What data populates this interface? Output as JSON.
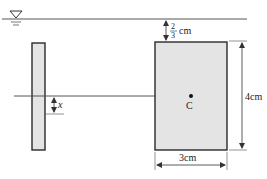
{
  "diagram": {
    "free_surface_symbol": "∇",
    "labels": {
      "depth_numerator": "2",
      "depth_denominator": "3",
      "depth_unit": "cm",
      "height": "4cm",
      "width": "3cm",
      "centroid": "C",
      "offset": "x"
    },
    "colors": {
      "line": "#333333",
      "plate_fill": "#e4e4e4",
      "plate_stroke": "#2a2a2a"
    }
  }
}
